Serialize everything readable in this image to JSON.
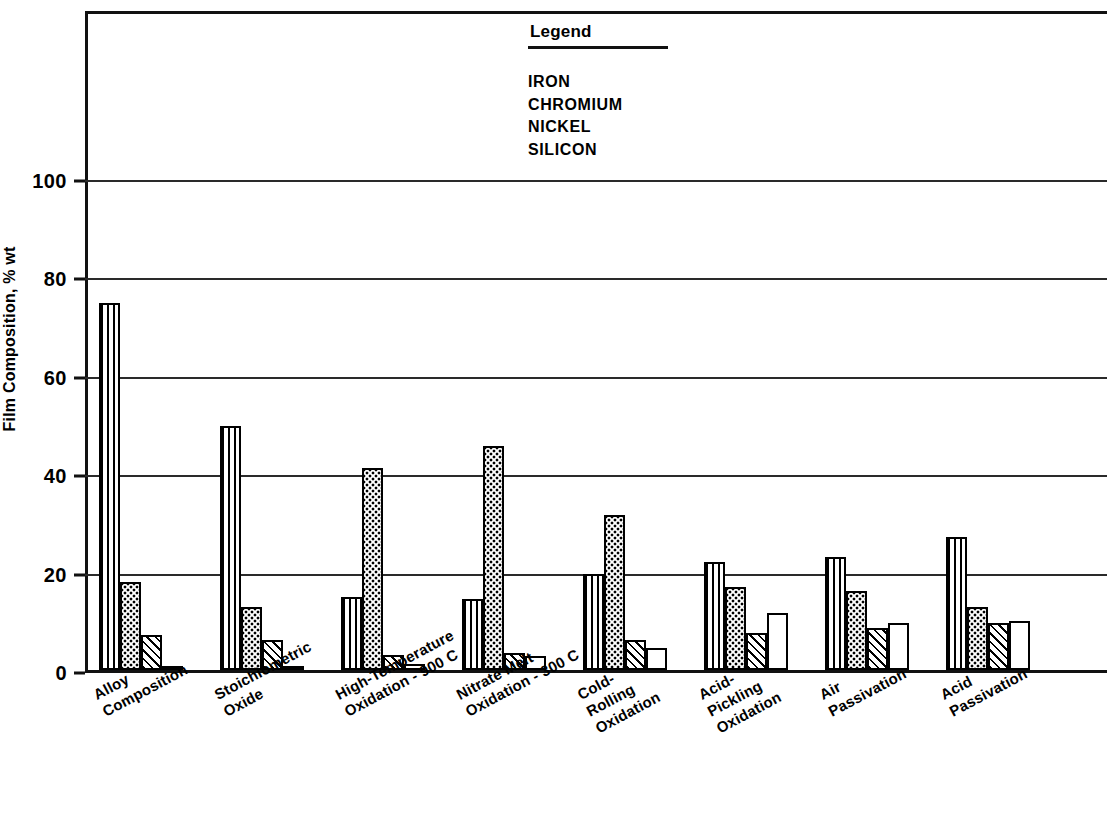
{
  "chart_data": {
    "type": "bar",
    "title": "",
    "xlabel": "",
    "ylabel": "Film Composition, % wt",
    "ylim": [
      0,
      110
    ],
    "yticks": [
      0,
      20,
      40,
      60,
      80,
      100
    ],
    "ytick_labels": [
      "0",
      "20",
      "40",
      "60",
      "80",
      "100"
    ],
    "grid": true,
    "legend_position": "top-center",
    "legend_title": "Legend",
    "categories": [
      "Alloy\nComposition",
      "Stoichiometric\nOxide",
      "High-Temperature\nOxidation - 900 C",
      "Nitrate Melt\nOxidation - 300 C",
      "Cold-\nRolling\nOxidation",
      "Acid-\nPickling\nOxidation",
      "Air\nPassivation",
      "Acid\nPassivation"
    ],
    "series": [
      {
        "name": "IRON",
        "pattern": "vertical-stripes",
        "values": [
          74.5,
          49.5,
          14.8,
          14.5,
          19.5,
          22.0,
          23.0,
          27.0
        ]
      },
      {
        "name": "CHROMIUM",
        "pattern": "dots",
        "values": [
          17.8,
          12.7,
          41.0,
          45.5,
          31.5,
          16.8,
          16.0,
          12.8
        ]
      },
      {
        "name": "NICKEL",
        "pattern": "crosshatch",
        "values": [
          7.2,
          6.0,
          3.0,
          3.5,
          6.0,
          7.5,
          8.5,
          9.5
        ]
      },
      {
        "name": "SILICON",
        "pattern": "blank",
        "values": [
          0.6,
          0.6,
          1.3,
          2.8,
          4.5,
          11.5,
          9.5,
          10.0
        ]
      }
    ]
  },
  "axes": {
    "y_title": "Film Composition, % wt"
  },
  "legend": {
    "title": "Legend",
    "entries": [
      "IRON",
      "CHROMIUM",
      "NICKEL",
      "SILICON"
    ]
  },
  "x_labels": [
    {
      "lines": [
        "Alloy",
        "Composition"
      ]
    },
    {
      "lines": [
        "Stoichiometric",
        "Oxide"
      ]
    },
    {
      "lines": [
        "High-Temperature",
        "Oxidation - 900 C"
      ]
    },
    {
      "lines": [
        "Nitrate Melt",
        "Oxidation - 300 C"
      ]
    },
    {
      "lines": [
        "Cold-",
        "Rolling",
        "Oxidation"
      ]
    },
    {
      "lines": [
        "Acid-",
        "Pickling",
        "Oxidation"
      ]
    },
    {
      "lines": [
        "Air",
        "Passivation"
      ]
    },
    {
      "lines": [
        "Acid",
        "Passivation"
      ]
    }
  ],
  "colors": {
    "ink": "#111111",
    "background": "#ffffff"
  }
}
